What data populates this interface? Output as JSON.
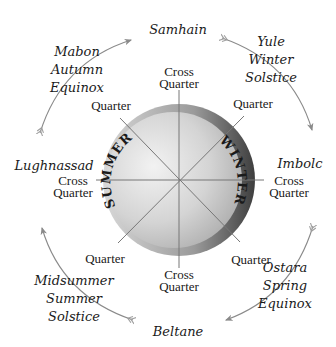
{
  "diagram": {
    "center_labels": {
      "left": "SUMMER",
      "right": "WINTER"
    },
    "festivals": {
      "top": "Samhain",
      "bottom": "Beltane",
      "left": "Lughnassad",
      "right": "Imbolc",
      "upper_right": [
        "Yule",
        "Winter",
        "Solstice"
      ],
      "upper_left": [
        "Mabon",
        "Autumn",
        "Equinox"
      ],
      "lower_right": [
        "Ostara",
        "Spring",
        "Equinox"
      ],
      "lower_left": [
        "Midsummer",
        "Summer",
        "Solstice"
      ]
    },
    "spoke_labels": {
      "top": [
        "Cross",
        "Quarter"
      ],
      "bottom": [
        "Cross",
        "Quarter"
      ],
      "left": [
        "Cross",
        "Quarter"
      ],
      "right": [
        "Cross",
        "Quarter"
      ],
      "upper_left": "Quarter",
      "upper_right": "Quarter",
      "lower_left": "Quarter",
      "lower_right": "Quarter"
    },
    "colors": {
      "disc_light": "#ececec",
      "disc_mid": "#b8b8b8",
      "disc_dark": "#5a5a5a",
      "line": "#777777",
      "arrow": "#8a8a8a",
      "text": "#1a1a1a"
    }
  }
}
